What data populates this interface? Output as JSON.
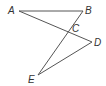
{
  "diagram": {
    "points": {
      "A": {
        "label": "A",
        "x": 19,
        "y": 11
      },
      "B": {
        "label": "B",
        "x": 83,
        "y": 11
      },
      "C": {
        "label": "C",
        "x": 68,
        "y": 32
      },
      "D": {
        "label": "D",
        "x": 92,
        "y": 42
      },
      "E": {
        "label": "E",
        "x": 38,
        "y": 75
      }
    },
    "segments": [
      [
        "A",
        "B"
      ],
      [
        "A",
        "D"
      ],
      [
        "B",
        "E"
      ],
      [
        "E",
        "D"
      ]
    ],
    "stroke_color": "#555555"
  }
}
